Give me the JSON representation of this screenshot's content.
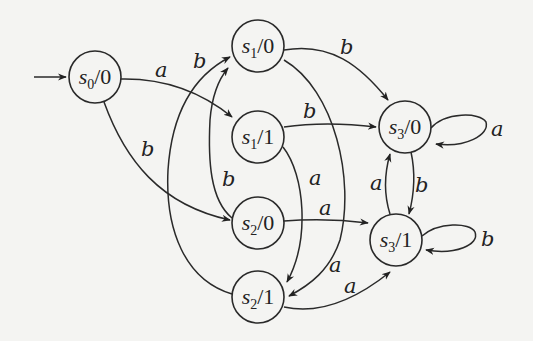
{
  "diagram": {
    "type": "finite-state-machine (Moore machine)",
    "start_state": "s0/0",
    "states": [
      {
        "id": "s0_0",
        "name": "s",
        "sub": "0",
        "output": "/0",
        "label": "s0/0",
        "cx": 95,
        "cy": 77
      },
      {
        "id": "s1_0",
        "name": "s",
        "sub": "1",
        "output": "/0",
        "label": "s1/0",
        "cx": 258,
        "cy": 46
      },
      {
        "id": "s1_1",
        "name": "s",
        "sub": "1",
        "output": "/1",
        "label": "s1/1",
        "cx": 258,
        "cy": 137
      },
      {
        "id": "s2_0",
        "name": "s",
        "sub": "2",
        "output": "/0",
        "label": "s2/0",
        "cx": 258,
        "cy": 223
      },
      {
        "id": "s2_1",
        "name": "s",
        "sub": "2",
        "output": "/1",
        "label": "s2/1",
        "cx": 258,
        "cy": 297
      },
      {
        "id": "s3_0",
        "name": "s",
        "sub": "3",
        "output": "/0",
        "label": "s3/0",
        "cx": 405,
        "cy": 127
      },
      {
        "id": "s3_1",
        "name": "s",
        "sub": "3",
        "output": "/1",
        "label": "s3/1",
        "cx": 396,
        "cy": 240
      }
    ],
    "transitions": [
      {
        "from": "s0/0",
        "to": "s1/1",
        "input": "a"
      },
      {
        "from": "s0/0",
        "to": "s2/0",
        "input": "b"
      },
      {
        "from": "s1/0",
        "to": "s3/0",
        "input": "b"
      },
      {
        "from": "s1/0",
        "to": "s2/1",
        "input": "a"
      },
      {
        "from": "s1/1",
        "to": "s3/0",
        "input": "b"
      },
      {
        "from": "s1/1",
        "to": "s2/1",
        "input": "a"
      },
      {
        "from": "s2/0",
        "to": "s1/0",
        "input": "b"
      },
      {
        "from": "s2/0",
        "to": "s3/1",
        "input": "a"
      },
      {
        "from": "s2/1",
        "to": "s1/0",
        "input": "b"
      },
      {
        "from": "s2/1",
        "to": "s3/1",
        "input": "a"
      },
      {
        "from": "s3/0",
        "to": "s3/0",
        "input": "a"
      },
      {
        "from": "s3/0",
        "to": "s3/1",
        "input": "b"
      },
      {
        "from": "s3/1",
        "to": "s3/0",
        "input": "a"
      },
      {
        "from": "s3/1",
        "to": "s3/1",
        "input": "b"
      }
    ],
    "edge_labels": {
      "s0_s11": "a",
      "s0_s20": "b",
      "s10_s30": "b",
      "s10_s21": "a",
      "s11_s30": "b",
      "s11_s21": "a",
      "s20_s10": "b",
      "s20_s31": "a",
      "s21_s10": "b",
      "s21_s31": "a",
      "s30_loop": "a",
      "s30_s31": "b",
      "s31_s30": "a",
      "s31_loop": "b"
    }
  }
}
